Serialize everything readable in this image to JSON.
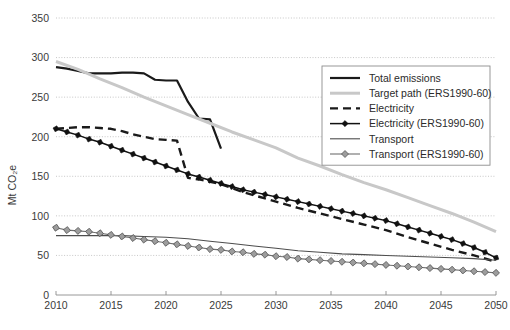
{
  "chart_data": {
    "type": "line",
    "title": "",
    "subtitle": "",
    "xlabel": "",
    "ylabel": "Mt CO₂e",
    "xlim": [
      2010,
      2050
    ],
    "ylim": [
      0,
      350
    ],
    "grid": true,
    "legend_position": "upper-right",
    "xticks": [
      "2010",
      "2015",
      "2020",
      "2025",
      "2030",
      "2035",
      "2040",
      "2045",
      "2050"
    ],
    "yticks": [
      "0",
      "50",
      "100",
      "150",
      "200",
      "250",
      "300",
      "350"
    ],
    "series": [
      {
        "name": "Total emissions",
        "style": "solid-thick-black",
        "color": "#1a1a1a",
        "x": [
          2010,
          2011,
          2012,
          2013,
          2014,
          2015,
          2016,
          2017,
          2018,
          2019,
          2020,
          2021,
          2022,
          2023,
          2024,
          2025
        ],
        "values": [
          288,
          286,
          283,
          280,
          280,
          280,
          281,
          281,
          280,
          272,
          271,
          271,
          244,
          223,
          222,
          185
        ]
      },
      {
        "name": "Target path (ERS1990-60)",
        "style": "solid-thick-grey",
        "color": "#c8c8c8",
        "x": [
          2010,
          2012,
          2014,
          2016,
          2018,
          2020,
          2022,
          2024,
          2026,
          2028,
          2030,
          2032,
          2034,
          2036,
          2038,
          2040,
          2042,
          2044,
          2046,
          2048,
          2050
        ],
        "values": [
          295,
          285,
          273,
          262,
          250,
          239,
          228,
          217,
          206,
          196,
          186,
          173,
          163,
          152,
          142,
          133,
          123,
          113,
          103,
          92,
          80
        ]
      },
      {
        "name": "Electricity",
        "style": "dashed-thick-black",
        "color": "#1a1a1a",
        "x": [
          2010,
          2011,
          2012,
          2013,
          2014,
          2015,
          2016,
          2017,
          2018,
          2019,
          2020,
          2021,
          2022,
          2023,
          2024,
          2025,
          2026,
          2027,
          2028,
          2029,
          2030,
          2032,
          2034,
          2036,
          2038,
          2040,
          2042,
          2044,
          2046,
          2048,
          2050
        ],
        "values": [
          210,
          211,
          212,
          212,
          211,
          210,
          207,
          203,
          200,
          197,
          196,
          195,
          148,
          146,
          143,
          140,
          135,
          130,
          126,
          122,
          118,
          110,
          103,
          96,
          89,
          82,
          73,
          65,
          57,
          50,
          42
        ]
      },
      {
        "name": "Electricity (ERS1990-60)",
        "style": "diamond-black",
        "color": "#111111",
        "marker": "diamond-filled-black",
        "x": [
          2010,
          2011,
          2012,
          2013,
          2014,
          2015,
          2016,
          2017,
          2018,
          2019,
          2020,
          2021,
          2022,
          2023,
          2024,
          2025,
          2026,
          2027,
          2028,
          2029,
          2030,
          2031,
          2032,
          2033,
          2034,
          2035,
          2036,
          2037,
          2038,
          2039,
          2040,
          2041,
          2042,
          2043,
          2044,
          2045,
          2046,
          2047,
          2048,
          2049,
          2050
        ],
        "values": [
          210,
          206,
          202,
          197,
          193,
          188,
          183,
          178,
          173,
          168,
          163,
          158,
          153,
          149,
          145,
          141,
          137,
          133,
          130,
          127,
          124,
          121,
          118,
          115,
          112,
          109,
          106,
          103,
          100,
          97,
          94,
          90,
          86,
          82,
          78,
          74,
          70,
          65,
          60,
          54,
          47
        ]
      },
      {
        "name": "Transport",
        "style": "solid-thin-grey",
        "color": "#4d4d4d",
        "x": [
          2010,
          2012,
          2014,
          2016,
          2018,
          2020,
          2022,
          2024,
          2026,
          2028,
          2030,
          2032,
          2034,
          2036,
          2038,
          2040,
          2042,
          2044,
          2046,
          2048,
          2050
        ],
        "values": [
          75,
          75,
          75,
          75,
          74,
          73,
          71,
          68,
          65,
          62,
          59,
          56,
          54,
          52,
          51,
          50,
          49,
          48,
          47,
          46,
          44
        ]
      },
      {
        "name": "Transport (ERS1990-60)",
        "style": "diamond-grey",
        "color": "#8e8e8e",
        "marker": "diamond-filled-grey",
        "x": [
          2010,
          2011,
          2012,
          2013,
          2014,
          2015,
          2016,
          2017,
          2018,
          2019,
          2020,
          2021,
          2022,
          2023,
          2024,
          2025,
          2026,
          2027,
          2028,
          2029,
          2030,
          2031,
          2032,
          2033,
          2034,
          2035,
          2036,
          2037,
          2038,
          2039,
          2040,
          2041,
          2042,
          2043,
          2044,
          2045,
          2046,
          2047,
          2048,
          2049,
          2050
        ],
        "values": [
          85,
          82,
          81,
          80,
          78,
          76,
          74,
          72,
          70,
          68,
          66,
          64,
          62,
          60,
          58,
          57,
          55,
          54,
          52,
          51,
          49,
          48,
          46,
          45,
          44,
          43,
          42,
          41,
          40,
          39,
          38,
          37,
          36,
          35,
          34,
          33,
          32,
          31,
          30,
          29,
          28
        ]
      }
    ]
  },
  "legend": {
    "items": [
      {
        "label": "Total emissions",
        "swatch": "solid-thick-black"
      },
      {
        "label": "Target path (ERS1990-60)",
        "swatch": "solid-thick-grey"
      },
      {
        "label": "Electricity",
        "swatch": "dashed-thick-black"
      },
      {
        "label": "Electricity (ERS1990-60)",
        "swatch": "diamond-black"
      },
      {
        "label": "Transport",
        "swatch": "solid-thin-grey"
      },
      {
        "label": "Transport (ERS1990-60)",
        "swatch": "diamond-grey"
      }
    ]
  },
  "colors": {
    "total_emissions": "#1a1a1a",
    "target_path": "#c8c8c8",
    "electricity_dashed": "#1a1a1a",
    "electricity_ers": "#111111",
    "transport": "#4d4d4d",
    "transport_ers": "#8e8e8e",
    "grid": "#b9b9b9",
    "axis": "#8d8d8d",
    "text": "#3a3a3a"
  }
}
